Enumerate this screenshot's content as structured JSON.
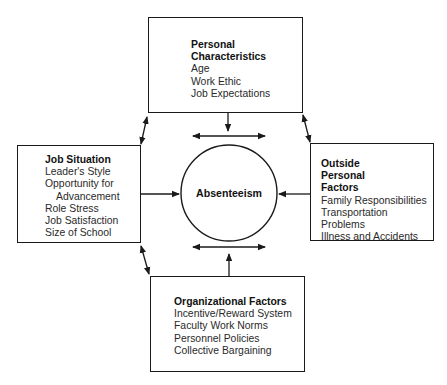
{
  "diagram": {
    "center": {
      "label": "Absenteeism"
    },
    "boxes": {
      "top": {
        "title_lines": [
          "Personal",
          "Characteristics"
        ],
        "items": [
          "Age",
          "Work Ethic",
          "Job Expectations"
        ]
      },
      "left": {
        "title_lines": [
          "Job Situation"
        ],
        "items": [
          "Leader's Style",
          "Opportunity for",
          "Advancement",
          "Role Stress",
          "Job Satisfaction",
          "Size of School"
        ]
      },
      "right": {
        "title_lines": [
          "Outside",
          "Personal",
          "Factors"
        ],
        "items": [
          "Family Responsibilities",
          "Transportation Problems",
          "Illness and Accidents"
        ]
      },
      "bottom": {
        "title_lines": [
          "Organizational Factors"
        ],
        "items": [
          "Incentive/Reward System",
          "Faculty Work Norms",
          "Personnel Policies",
          "Collective Bargaining"
        ]
      }
    },
    "colors": {
      "line": "#1a1a1a",
      "background": "#ffffff"
    }
  }
}
